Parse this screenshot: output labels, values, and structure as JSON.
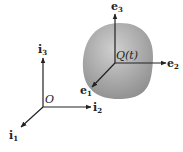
{
  "diagram": {
    "body_label": "Q(t)",
    "origin_label": "O",
    "fixed_frame": {
      "i1": "i",
      "i1_sub": "1",
      "i2": "i",
      "i2_sub": "2",
      "i3": "i",
      "i3_sub": "3"
    },
    "body_frame": {
      "e1": "e",
      "e1_sub": "1",
      "e2": "e",
      "e2_sub": "2",
      "e3": "e",
      "e3_sub": "3"
    },
    "colors": {
      "body_fill": "#9a9a9a",
      "body_highlight": "#d4d4d4",
      "axis": "#222222"
    }
  }
}
